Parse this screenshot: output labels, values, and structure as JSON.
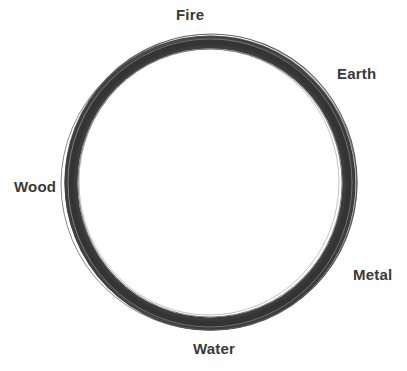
{
  "diagram": {
    "type": "cycle",
    "shape": "ring",
    "ring_color": "#3c3c3c",
    "label_color": "#3a3a3a",
    "background": "#ffffff",
    "elements": [
      {
        "id": "fire",
        "label": "Fire",
        "position": "top"
      },
      {
        "id": "earth",
        "label": "Earth",
        "position": "upper-right"
      },
      {
        "id": "metal",
        "label": "Metal",
        "position": "lower-right"
      },
      {
        "id": "water",
        "label": "Water",
        "position": "bottom"
      },
      {
        "id": "wood",
        "label": "Wood",
        "position": "left"
      }
    ]
  }
}
